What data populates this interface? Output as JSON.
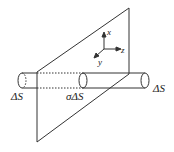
{
  "diagram": {
    "labels": {
      "left_area": "ΔS",
      "middle_area": "σΔS",
      "right_area": "ΔS",
      "axis_x": "x",
      "axis_y": "y",
      "axis_z": "z"
    },
    "colors": {
      "stroke": "#333333",
      "background": "#ffffff"
    }
  }
}
